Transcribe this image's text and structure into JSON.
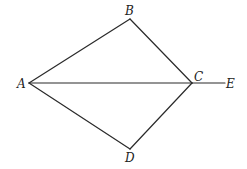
{
  "diagram": {
    "type": "geometry",
    "points": {
      "A": {
        "x": 29,
        "y": 83,
        "label": "A",
        "label_x": 17,
        "label_y": 88
      },
      "B": {
        "x": 130,
        "y": 19,
        "label": "B",
        "label_x": 125,
        "label_y": 15
      },
      "C": {
        "x": 192,
        "y": 83,
        "label": "C",
        "label_x": 194,
        "label_y": 81
      },
      "D": {
        "x": 130,
        "y": 149,
        "label": "D",
        "label_x": 125,
        "label_y": 162
      },
      "E": {
        "x": 225,
        "y": 83,
        "label": "E",
        "label_x": 226,
        "label_y": 88
      }
    },
    "segments": [
      {
        "from": "A",
        "to": "B",
        "name": "segment-ab"
      },
      {
        "from": "B",
        "to": "C",
        "name": "segment-bc"
      },
      {
        "from": "C",
        "to": "D",
        "name": "segment-cd"
      },
      {
        "from": "D",
        "to": "A",
        "name": "segment-da"
      },
      {
        "from": "A",
        "to": "C",
        "name": "segment-ac"
      },
      {
        "from": "C",
        "to": "E",
        "name": "segment-ce"
      }
    ],
    "colors": {
      "line": "#2a2a2a",
      "label": "#222222",
      "background": "#ffffff"
    }
  }
}
